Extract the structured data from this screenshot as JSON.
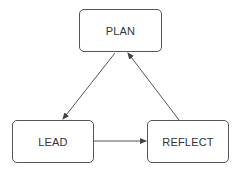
{
  "diagram": {
    "type": "cycle",
    "nodes": [
      {
        "id": "plan",
        "label": "PLAN"
      },
      {
        "id": "lead",
        "label": "LEAD"
      },
      {
        "id": "reflect",
        "label": "REFLECT"
      }
    ],
    "edges": [
      {
        "from": "plan",
        "to": "lead"
      },
      {
        "from": "lead",
        "to": "reflect"
      },
      {
        "from": "reflect",
        "to": "plan"
      }
    ],
    "colors": {
      "stroke": "#555555",
      "text": "#333333",
      "background": "#ffffff"
    }
  }
}
